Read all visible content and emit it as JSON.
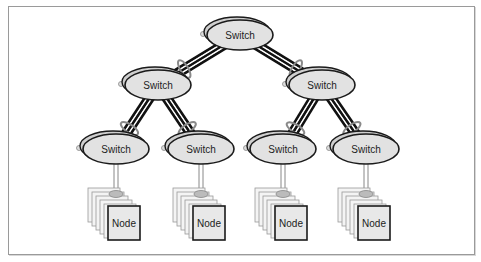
{
  "diagram": {
    "type": "fat-tree network topology",
    "colors": {
      "switch_fill": "#e2e2e2",
      "switch_stroke": "#1a1a1a",
      "link": "#111111",
      "link_ring": "#8a8a8a",
      "node_fill": "#e8e8e8",
      "frame": "#9a9a9a"
    },
    "switches": [
      {
        "id": "root",
        "label": "Switch",
        "level": 0,
        "cx": 240,
        "cy": 35
      },
      {
        "id": "agg-left",
        "label": "Switch",
        "level": 1,
        "cx": 158,
        "cy": 85
      },
      {
        "id": "agg-right",
        "label": "Switch",
        "level": 1,
        "cx": 322,
        "cy": 85
      },
      {
        "id": "edge-1",
        "label": "Switch",
        "level": 2,
        "cx": 116,
        "cy": 149
      },
      {
        "id": "edge-2",
        "label": "Switch",
        "level": 2,
        "cx": 201,
        "cy": 149
      },
      {
        "id": "edge-3",
        "label": "Switch",
        "level": 2,
        "cx": 283,
        "cy": 149
      },
      {
        "id": "edge-4",
        "label": "Switch",
        "level": 2,
        "cx": 366,
        "cy": 149
      }
    ],
    "links": [
      {
        "from": "root",
        "to": "agg-left"
      },
      {
        "from": "root",
        "to": "agg-right"
      },
      {
        "from": "agg-left",
        "to": "edge-1"
      },
      {
        "from": "agg-left",
        "to": "edge-2"
      },
      {
        "from": "agg-right",
        "to": "edge-3"
      },
      {
        "from": "agg-right",
        "to": "edge-4"
      }
    ],
    "node_stacks": [
      {
        "id": "stack-1",
        "label": "Node",
        "parent": "edge-1",
        "x": 108,
        "y": 206
      },
      {
        "id": "stack-2",
        "label": "Node",
        "parent": "edge-2",
        "x": 193,
        "y": 206
      },
      {
        "id": "stack-3",
        "label": "Node",
        "parent": "edge-3",
        "x": 275,
        "y": 206
      },
      {
        "id": "stack-4",
        "label": "Node",
        "parent": "edge-4",
        "x": 358,
        "y": 206
      }
    ]
  }
}
